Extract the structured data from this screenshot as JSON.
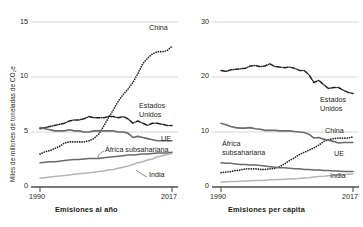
{
  "figure": {
    "background": "#ffffff",
    "text_color": "#231f20",
    "grid_color": "#d8d8d8",
    "axis_color": "#4d4d4d"
  },
  "panels": [
    {
      "id": "left",
      "ylabel": "Miles de millones de toneladas de CO₂e",
      "xlabel": "Emisiones al año",
      "yticks": [
        "15",
        "10",
        "5",
        "0"
      ],
      "xticks": [
        "1990",
        "2017"
      ],
      "labels": {
        "china": "China",
        "us_line1": "Estados",
        "us_line2": "Unidos",
        "eu": "UE",
        "africa": "África subsahariana",
        "india": "India"
      }
    },
    {
      "id": "right",
      "ylabel": "Toneladas de CO₂e",
      "xlabel": "Emisiones per cápita",
      "yticks": [
        "30",
        "20",
        "10",
        "0"
      ],
      "xticks": [
        "1990",
        "2017"
      ],
      "labels": {
        "us_line1": "Estados",
        "us_line2": "Unidos",
        "china": "China",
        "eu": "UE",
        "africa_line1": "África",
        "africa_line2": "subsahariana",
        "india": "India"
      }
    }
  ],
  "chart_data": [
    {
      "type": "line",
      "title": "Emisiones al año",
      "xlabel": "Emisiones al año",
      "ylabel": "Miles de millones de toneladas de CO₂e",
      "xlim": [
        1990,
        2017
      ],
      "ylim": [
        0,
        15
      ],
      "yticks": [
        0,
        5,
        10,
        15
      ],
      "xticks": [
        1990,
        2017
      ],
      "grid": "horizontal",
      "legend": "inline-labels",
      "x": [
        1990,
        1991,
        1992,
        1993,
        1994,
        1995,
        1996,
        1997,
        1998,
        1999,
        2000,
        2001,
        2002,
        2003,
        2004,
        2005,
        2006,
        2007,
        2008,
        2009,
        2010,
        2011,
        2012,
        2013,
        2014,
        2015,
        2016,
        2017
      ],
      "series": [
        {
          "name": "China",
          "style": "dotted",
          "color": "#231f20",
          "values": [
            3.0,
            3.2,
            3.3,
            3.5,
            3.7,
            4.0,
            4.1,
            4.1,
            4.1,
            4.1,
            4.2,
            4.4,
            4.8,
            5.5,
            6.3,
            7.0,
            7.8,
            8.4,
            8.9,
            9.5,
            10.3,
            11.2,
            11.7,
            12.1,
            12.3,
            12.3,
            12.4,
            12.8
          ]
        },
        {
          "name": "Estados Unidos",
          "style": "dash-dot",
          "color": "#231f20",
          "values": [
            5.3,
            5.4,
            5.5,
            5.6,
            5.7,
            5.8,
            6.0,
            6.1,
            6.1,
            6.2,
            6.4,
            6.3,
            6.3,
            6.3,
            6.4,
            6.4,
            6.3,
            6.4,
            6.2,
            5.8,
            6.0,
            5.8,
            5.6,
            5.8,
            5.8,
            5.7,
            5.6,
            5.6
          ]
        },
        {
          "name": "UE",
          "style": "solid",
          "color": "#6a6a6a",
          "width": 1.6,
          "values": [
            5.4,
            5.3,
            5.2,
            5.1,
            5.1,
            5.1,
            5.2,
            5.1,
            5.1,
            5.0,
            5.0,
            5.1,
            5.1,
            5.1,
            5.1,
            5.1,
            5.0,
            5.0,
            4.9,
            4.5,
            4.6,
            4.5,
            4.4,
            4.3,
            4.2,
            4.2,
            4.2,
            4.2
          ]
        },
        {
          "name": "África subsahariana",
          "style": "solid",
          "color": "#6a6a6a",
          "width": 1.5,
          "values": [
            2.2,
            2.25,
            2.3,
            2.3,
            2.35,
            2.4,
            2.45,
            2.5,
            2.5,
            2.55,
            2.6,
            2.6,
            2.6,
            2.65,
            2.7,
            2.75,
            2.8,
            2.85,
            2.9,
            2.9,
            2.95,
            3.0,
            3.0,
            3.05,
            3.1,
            3.1,
            3.1,
            3.15
          ]
        },
        {
          "name": "India",
          "style": "solid",
          "color": "#b5b5b5",
          "width": 1.5,
          "values": [
            0.8,
            0.85,
            0.9,
            0.95,
            1.0,
            1.05,
            1.1,
            1.15,
            1.2,
            1.25,
            1.3,
            1.35,
            1.4,
            1.45,
            1.55,
            1.6,
            1.7,
            1.8,
            1.9,
            2.05,
            2.2,
            2.3,
            2.45,
            2.55,
            2.75,
            2.85,
            2.95,
            3.05
          ]
        }
      ]
    },
    {
      "type": "line",
      "title": "Emisiones per cápita",
      "xlabel": "Emisiones per cápita",
      "ylabel": "Toneladas de CO₂e",
      "xlim": [
        1990,
        2017
      ],
      "ylim": [
        0,
        30
      ],
      "yticks": [
        0,
        10,
        20,
        30
      ],
      "xticks": [
        1990,
        2017
      ],
      "grid": "horizontal",
      "legend": "inline-labels",
      "x": [
        1990,
        1991,
        1992,
        1993,
        1994,
        1995,
        1996,
        1997,
        1998,
        1999,
        2000,
        2001,
        2002,
        2003,
        2004,
        2005,
        2006,
        2007,
        2008,
        2009,
        2010,
        2011,
        2012,
        2013,
        2014,
        2015,
        2016,
        2017
      ],
      "series": [
        {
          "name": "Estados Unidos",
          "style": "dash-dot",
          "color": "#231f20",
          "values": [
            21.2,
            21.0,
            21.3,
            21.4,
            21.5,
            21.6,
            22.0,
            22.1,
            21.9,
            22.0,
            22.4,
            21.9,
            21.8,
            21.7,
            21.8,
            21.6,
            21.2,
            21.2,
            20.4,
            19.0,
            19.4,
            18.6,
            17.9,
            18.1,
            18.1,
            17.6,
            17.2,
            17.0
          ]
        },
        {
          "name": "China",
          "style": "dotted",
          "color": "#231f20",
          "values": [
            2.6,
            2.7,
            2.8,
            3.0,
            3.1,
            3.3,
            3.3,
            3.3,
            3.2,
            3.2,
            3.3,
            3.4,
            3.7,
            4.2,
            4.8,
            5.3,
            5.9,
            6.3,
            6.7,
            7.1,
            7.6,
            8.3,
            8.6,
            8.8,
            8.9,
            8.9,
            8.9,
            9.1
          ]
        },
        {
          "name": "UE",
          "style": "solid",
          "color": "#6a6a6a",
          "width": 1.6,
          "values": [
            11.6,
            11.3,
            11.0,
            10.8,
            10.7,
            10.7,
            10.8,
            10.6,
            10.5,
            10.3,
            10.3,
            10.3,
            10.2,
            10.2,
            10.2,
            10.1,
            10.0,
            9.9,
            9.6,
            8.9,
            9.0,
            8.7,
            8.5,
            8.3,
            8.0,
            8.1,
            8.1,
            8.1
          ]
        },
        {
          "name": "África subsahariana",
          "style": "solid",
          "color": "#6a6a6a",
          "width": 1.5,
          "values": [
            4.4,
            4.3,
            4.3,
            4.2,
            4.1,
            4.1,
            4.0,
            4.0,
            3.9,
            3.8,
            3.7,
            3.6,
            3.5,
            3.5,
            3.4,
            3.3,
            3.3,
            3.2,
            3.2,
            3.1,
            3.1,
            3.0,
            3.0,
            2.9,
            2.9,
            2.8,
            2.8,
            2.8
          ]
        },
        {
          "name": "India",
          "style": "solid",
          "color": "#b5b5b5",
          "width": 1.5,
          "values": [
            0.9,
            0.95,
            1.0,
            1.0,
            1.05,
            1.1,
            1.15,
            1.2,
            1.2,
            1.25,
            1.3,
            1.3,
            1.35,
            1.4,
            1.45,
            1.5,
            1.55,
            1.65,
            1.7,
            1.8,
            1.9,
            1.95,
            2.05,
            2.1,
            2.2,
            2.25,
            2.3,
            2.35
          ]
        }
      ]
    }
  ]
}
